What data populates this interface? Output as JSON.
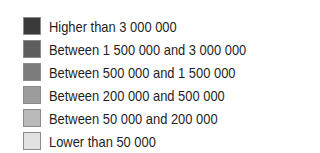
{
  "legend": {
    "items": [
      {
        "label": "Higher than 3 000 000",
        "color": "#3a3a3a"
      },
      {
        "label": "Between 1 500 000 and 3 000 000",
        "color": "#5e5e5e"
      },
      {
        "label": "Between 500 000 and 1 500 000",
        "color": "#7c7c7c"
      },
      {
        "label": "Between 200 000 and 500 000",
        "color": "#9c9c9c"
      },
      {
        "label": "Between 50 000 and 200 000",
        "color": "#bababa"
      },
      {
        "label": "Lower than 50 000",
        "color": "#e2e2e2"
      }
    ]
  }
}
